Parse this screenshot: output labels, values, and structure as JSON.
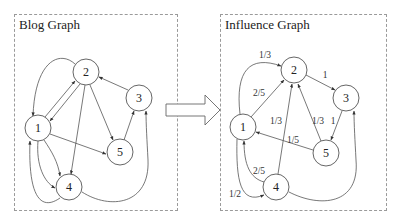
{
  "left_panel": {
    "title": "Blog Graph",
    "nodes": [
      {
        "id": "1",
        "label": "1"
      },
      {
        "id": "2",
        "label": "2"
      },
      {
        "id": "3",
        "label": "3"
      },
      {
        "id": "4",
        "label": "4"
      },
      {
        "id": "5",
        "label": "5"
      }
    ],
    "edges": [
      {
        "from": "2",
        "to": "1"
      },
      {
        "from": "1",
        "to": "2"
      },
      {
        "from": "2",
        "to": "1",
        "curved": true
      },
      {
        "from": "2",
        "to": "4"
      },
      {
        "from": "2",
        "to": "5"
      },
      {
        "from": "3",
        "to": "2"
      },
      {
        "from": "5",
        "to": "3"
      },
      {
        "from": "1",
        "to": "5"
      },
      {
        "from": "1",
        "to": "4"
      },
      {
        "from": "1",
        "to": "4",
        "curved": true
      },
      {
        "from": "4",
        "to": "1",
        "curved": true
      },
      {
        "from": "4",
        "to": "3",
        "curved": true
      }
    ]
  },
  "transform_arrow": {
    "icon": "right-arrow-icon"
  },
  "right_panel": {
    "title": "Influence Graph",
    "nodes": [
      {
        "id": "1",
        "label": "1"
      },
      {
        "id": "2",
        "label": "2"
      },
      {
        "id": "3",
        "label": "3"
      },
      {
        "id": "4",
        "label": "4"
      },
      {
        "id": "5",
        "label": "5"
      }
    ],
    "edges": [
      {
        "from": "1",
        "to": "2",
        "weight": "1/3",
        "curved": true
      },
      {
        "from": "1",
        "to": "2",
        "weight": "2/5"
      },
      {
        "from": "2",
        "to": "3",
        "weight": "1"
      },
      {
        "from": "4",
        "to": "2",
        "weight": "1/3"
      },
      {
        "from": "5",
        "to": "2",
        "weight": "1/3"
      },
      {
        "from": "3",
        "to": "5",
        "weight": "1"
      },
      {
        "from": "5",
        "to": "1",
        "weight": "1/5"
      },
      {
        "from": "4",
        "to": "1",
        "weight": "2/5",
        "curved": true
      },
      {
        "from": "1",
        "to": "4",
        "weight": "1/2",
        "curved": true
      },
      {
        "from": "4",
        "to": "3",
        "curved": true
      }
    ],
    "weights": {
      "w_1_2_curve": "1/3",
      "w_1_2": "2/5",
      "w_2_3": "1",
      "w_4_2": "1/3",
      "w_5_2": "1/3",
      "w_3_5": "1",
      "w_5_1": "1/5",
      "w_4_1": "2/5",
      "w_1_4": "1/2"
    }
  }
}
